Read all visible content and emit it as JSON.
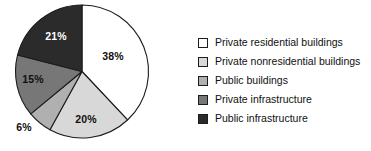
{
  "chart_data": {
    "type": "pie",
    "title": "",
    "subtitle": "",
    "xlabel": "",
    "ylabel": "",
    "grid": false,
    "legend_position": "right",
    "start_angle_deg": 0,
    "direction": "clockwise",
    "categories": [
      "Private residential buildings",
      "Private nonresidential buildings",
      "Public buildings",
      "Private infrastructure",
      "Public infrastructure"
    ],
    "values": [
      38,
      20,
      6,
      15,
      21
    ],
    "data_labels": [
      "38%",
      "20%",
      "6%",
      "15%",
      "21%"
    ],
    "colors": [
      "#ffffff",
      "#d8d8d8",
      "#b0b0b0",
      "#777777",
      "#2b2b2b"
    ],
    "label_text_colors": [
      "#101010",
      "#101010",
      "#101010",
      "#101010",
      "#ffffff"
    ],
    "slices": [
      {
        "label": "Private residential buildings",
        "value": 38,
        "data_label": "38%",
        "color": "#ffffff",
        "label_color": "#101010",
        "label_x": 113,
        "label_y": 60,
        "label_anchor": "middle"
      },
      {
        "label": "Private nonresidential buildings",
        "value": 20,
        "data_label": "20%",
        "color": "#d8d8d8",
        "label_color": "#101010",
        "label_x": 86,
        "label_y": 123,
        "label_anchor": "middle"
      },
      {
        "label": "Public buildings",
        "value": 6,
        "data_label": "6%",
        "color": "#b0b0b0",
        "label_color": "#101010",
        "label_x": 24,
        "label_y": 131,
        "label_anchor": "middle"
      },
      {
        "label": "Private infrastructure",
        "value": 15,
        "data_label": "15%",
        "color": "#777777",
        "label_color": "#101010",
        "label_x": 33,
        "label_y": 83,
        "label_anchor": "middle"
      },
      {
        "label": "Public infrastructure",
        "value": 21,
        "data_label": "21%",
        "color": "#2b2b2b",
        "label_color": "#ffffff",
        "label_x": 56,
        "label_y": 40,
        "label_anchor": "middle"
      }
    ]
  },
  "legend": {
    "items": [
      {
        "label": "Private residential buildings",
        "color": "#ffffff"
      },
      {
        "label": "Private nonresidential buildings",
        "color": "#d8d8d8"
      },
      {
        "label": "Public buildings",
        "color": "#b0b0b0"
      },
      {
        "label": "Private infrastructure",
        "color": "#777777"
      },
      {
        "label": "Public infrastructure",
        "color": "#2b2b2b"
      }
    ]
  }
}
